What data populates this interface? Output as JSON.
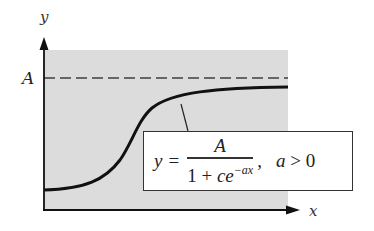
{
  "figure": {
    "axis_labels": {
      "x": "x",
      "y": "y"
    },
    "asymptote_label": "A",
    "formula": {
      "lhs": "y",
      "equals": "=",
      "numerator": "A",
      "denominator_prefix": "1 + ",
      "denominator_c": "c",
      "denominator_e": "e",
      "exponent": "−ax",
      "separator": ",",
      "condition_var": "a",
      "condition_op": " > 0"
    },
    "colors": {
      "shading": "#dcdcdc",
      "curve": "#111111",
      "asymptote": "#666666",
      "axes": "#111111"
    }
  }
}
